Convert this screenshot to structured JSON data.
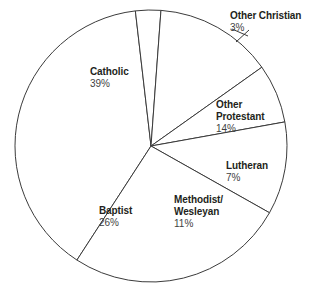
{
  "chart_data": {
    "type": "pie",
    "title": "",
    "subtitle": "",
    "xlabel": "",
    "ylabel": "",
    "legend_position": "none",
    "grid": false,
    "labels_inline": true,
    "categories": [
      "Catholic",
      "Other Christian",
      "Other Protestant",
      "Lutheran",
      "Methodist/Wesleyan",
      "Baptist"
    ],
    "values": [
      39,
      14,
      7,
      11,
      26,
      3
    ],
    "unit": "%",
    "slices": [
      {
        "label": "Catholic",
        "value": 39,
        "value_text": "39%",
        "start_angle_deg": 213,
        "end_angle_deg": 353.4
      },
      {
        "label": "Other Christian",
        "value": 3,
        "value_text": "3%",
        "start_angle_deg": 353.4,
        "end_angle_deg": 364.2
      },
      {
        "label": "Other Protestant",
        "value": 14,
        "value_text": "14%",
        "start_angle_deg": 364.2,
        "end_angle_deg": 414.6
      },
      {
        "label": "Lutheran",
        "value": 7,
        "value_text": "7%",
        "start_angle_deg": 414.6,
        "end_angle_deg": 439.8
      },
      {
        "label": "Methodist/Wesleyan",
        "value": 11,
        "value_text": "11%",
        "start_angle_deg": 439.8,
        "end_angle_deg": 479.4
      },
      {
        "label": "Baptist",
        "value": 26,
        "value_text": "26%",
        "start_angle_deg": 479.4,
        "end_angle_deg": 573
      }
    ],
    "colors": {
      "slice_fill": "#ffffff",
      "slice_stroke": "#3b3b3b",
      "label_text": "#231f20",
      "value_text": "#3f3f3f",
      "background": "#ffffff"
    }
  },
  "labels": {
    "catholic": {
      "name": "Catholic",
      "pct": "39%"
    },
    "other_christian": {
      "name": "Other Christian",
      "pct": "3%"
    },
    "other_protestant": {
      "name_line1": "Other",
      "name_line2": "Protestant",
      "pct": "14%"
    },
    "lutheran": {
      "name": "Lutheran",
      "pct": "7%"
    },
    "methodist": {
      "name_line1": "Methodist/",
      "name_line2": "Wesleyan",
      "pct": "11%"
    },
    "baptist": {
      "name": "Baptist",
      "pct": "26%"
    }
  }
}
